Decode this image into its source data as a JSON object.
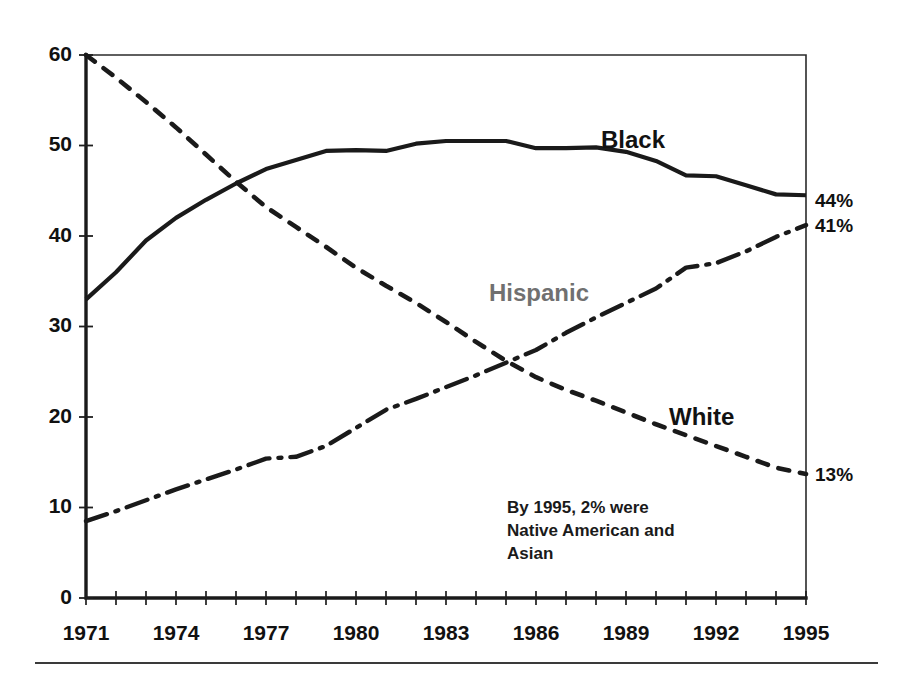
{
  "chart_data": {
    "type": "line",
    "title": "",
    "subtitle": "",
    "xlabel": "",
    "ylabel": "",
    "xlim": [
      1971,
      1995
    ],
    "ylim": [
      0,
      60
    ],
    "grid": false,
    "legend_position": "inline-labels",
    "x": [
      1971,
      1972,
      1973,
      1974,
      1975,
      1976,
      1977,
      1978,
      1979,
      1980,
      1981,
      1982,
      1983,
      1984,
      1985,
      1986,
      1987,
      1988,
      1989,
      1990,
      1991,
      1992,
      1993,
      1994,
      1995
    ],
    "x_tick_labels": [
      "1971",
      "1974",
      "1977",
      "1980",
      "1983",
      "1986",
      "1989",
      "1992",
      "1995"
    ],
    "x_tick_values": [
      1971,
      1974,
      1977,
      1980,
      1983,
      1986,
      1989,
      1992,
      1995
    ],
    "y_tick_labels": [
      "0",
      "10",
      "20",
      "30",
      "40",
      "50",
      "60"
    ],
    "y_tick_values": [
      0,
      10,
      20,
      30,
      40,
      50,
      60
    ],
    "series": [
      {
        "name": "Black",
        "label": "Black",
        "line_style": "solid",
        "color": "#1a1a1a",
        "end_label": "44%",
        "end_value": 44,
        "values": [
          33,
          36,
          39.5,
          42,
          44,
          45.8,
          47.4,
          48.4,
          49.4,
          49.5,
          49.4,
          50.2,
          50.5,
          50.5,
          50.5,
          49.7,
          49.7,
          49.8,
          49.3,
          48.3,
          46.7,
          46.6,
          45.6,
          44.6,
          44.5
        ]
      },
      {
        "name": "White",
        "label": "White",
        "line_style": "dotted",
        "color": "#1a1a1a",
        "end_label": "13%",
        "end_value": 13,
        "values": [
          60,
          57.5,
          54.8,
          52,
          49,
          46,
          43.2,
          41,
          38.8,
          36.5,
          34.5,
          32.6,
          30.5,
          28.3,
          26.2,
          24.4,
          23,
          21.8,
          20.5,
          19.2,
          18,
          16.8,
          15.6,
          14.4,
          13.7
        ]
      },
      {
        "name": "Hispanic",
        "label": "Hispanic",
        "line_style": "dash-dot",
        "color": "#1a1a1a",
        "end_label": "41%",
        "end_value": 41,
        "values": [
          8.5,
          9.6,
          10.8,
          12,
          13.1,
          14.2,
          15.4,
          15.6,
          16.8,
          18.8,
          20.8,
          22,
          23.3,
          24.6,
          26,
          27.4,
          29.3,
          31,
          32.6,
          34.2,
          36.5,
          37,
          38.3,
          39.9,
          41.2
        ]
      }
    ],
    "annotations": [
      {
        "name": "other-groups-note",
        "lines": [
          "By 1995, 2% were",
          "Native American and",
          "Asian"
        ]
      }
    ]
  },
  "labels": {
    "series_black": "Black",
    "series_white": "White",
    "series_hispanic": "Hispanic",
    "end_black": "44%",
    "end_hispanic": "41%",
    "end_white": "13%",
    "annotation_line_1": "By 1995, 2% were",
    "annotation_line_2": "Native American and",
    "annotation_line_3": "Asian",
    "y_0": "0",
    "y_10": "10",
    "y_20": "20",
    "y_30": "30",
    "y_40": "40",
    "y_50": "50",
    "y_60": "60",
    "x_1971": "1971",
    "x_1974": "1974",
    "x_1977": "1977",
    "x_1980": "1980",
    "x_1983": "1983",
    "x_1986": "1986",
    "x_1989": "1989",
    "x_1992": "1992",
    "x_1995": "1995"
  },
  "colors": {
    "ink": "#1a1a1a",
    "background": "#ffffff",
    "rule": "#3a3a3a"
  }
}
